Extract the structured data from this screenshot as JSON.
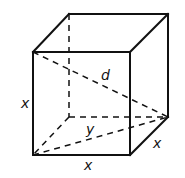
{
  "figure": {
    "type": "cube-diagonal-diagram",
    "labels": {
      "front_height": "x",
      "front_width": "x",
      "depth": "x",
      "space_diagonal": "d",
      "face_diagonal": "y"
    },
    "colors": {
      "stroke": "#111111",
      "background": "#ffffff"
    }
  }
}
